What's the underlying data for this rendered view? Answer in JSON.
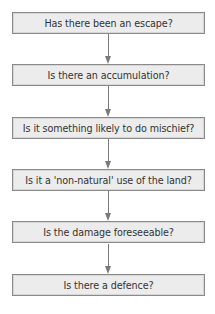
{
  "diagram": {
    "type": "flowchart",
    "direction": "top-to-bottom",
    "colors": {
      "box_fill": "#ececec",
      "box_border": "#8a8a8a",
      "arrow": "#7a7a7a",
      "text": "#333333"
    },
    "steps": [
      {
        "label": "Has there been an escape?"
      },
      {
        "label": "Is there an accumulation?"
      },
      {
        "label": "Is it something likely to do mischief?"
      },
      {
        "label": "Is it a 'non-natural' use of the land?"
      },
      {
        "label": "Is the damage foreseeable?"
      },
      {
        "label": "Is there a defence?"
      }
    ],
    "connectors": [
      {
        "from": 0,
        "to": 1
      },
      {
        "from": 1,
        "to": 2
      },
      {
        "from": 2,
        "to": 3
      },
      {
        "from": 3,
        "to": 4
      },
      {
        "from": 4,
        "to": 5
      }
    ]
  }
}
